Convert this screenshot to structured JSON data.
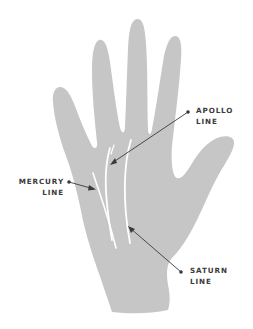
{
  "diagram": {
    "colors": {
      "hand": "#c6c6c6",
      "palm_lines": "#ffffff",
      "pointer": "#3a3a3a",
      "label_text": "#3b3b3b",
      "background": "#ffffff"
    },
    "labels": [
      {
        "id": "apollo",
        "line1": "APOLLO",
        "line2": "LINE"
      },
      {
        "id": "mercury",
        "line1": "MERCURY",
        "line2": "LINE"
      },
      {
        "id": "saturn",
        "line1": "SATURN",
        "line2": "LINE"
      }
    ]
  }
}
